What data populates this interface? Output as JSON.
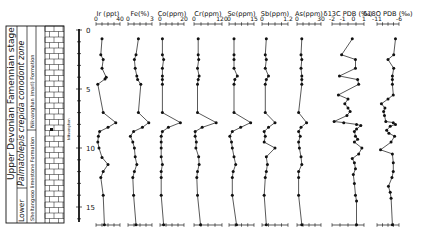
{
  "chart_data": {
    "type": "line",
    "title": "",
    "ylabel": "Depth (m)",
    "y_axis": {
      "ticks": [
        0,
        5,
        10,
        15
      ],
      "range": [
        0,
        16.5
      ],
      "inverted": true
    },
    "stratigraphy": {
      "system_stage": "Upper Devonian  Famennian  stage",
      "substage": "Lower",
      "conodont_zone": "Palmatolepis crepida  conodont zone",
      "formations": [
        {
          "name": "Sheltangxoo limestone Formation",
          "from": 8.5,
          "to": 16.5
        },
        {
          "name": "Nikvanghan (marl) Formation",
          "from": 0,
          "to": 8.5
        }
      ],
      "marker_label": "Nikvanghan",
      "marker_depth": 8.5
    },
    "panels": [
      {
        "name": "Ir (ppt)",
        "xmin": 0,
        "xmax": 40,
        "ticks": [
          "0",
          "40"
        ],
        "points": [
          [
            10,
            1.5
          ],
          [
            8,
            4.2
          ],
          [
            12,
            5
          ],
          [
            10,
            6.5
          ],
          [
            17,
            8
          ],
          [
            15,
            8.3
          ],
          [
            3,
            9.2
          ],
          [
            12,
            14
          ],
          [
            33,
            15.7
          ],
          [
            20,
            16.5
          ],
          [
            6,
            17.2
          ],
          [
            4,
            18
          ],
          [
            3,
            19
          ],
          [
            5,
            20
          ],
          [
            10,
            21.6
          ],
          [
            20,
            22.8
          ],
          [
            12,
            24
          ],
          [
            8,
            25
          ],
          [
            12,
            28
          ],
          [
            14,
            33
          ]
        ]
      },
      {
        "name": "Fe(%)",
        "xmin": 0,
        "xmax": 3,
        "ticks": [
          "0",
          "3"
        ],
        "points": [
          [
            1.3,
            1.5
          ],
          [
            1,
            4.2
          ],
          [
            0.8,
            5
          ],
          [
            0.9,
            6.5
          ],
          [
            1.1,
            7.8
          ],
          [
            1.2,
            8.4
          ],
          [
            1.6,
            9.2
          ],
          [
            1.3,
            14
          ],
          [
            2.6,
            15.7
          ],
          [
            1.8,
            16.5
          ],
          [
            0.7,
            17.2
          ],
          [
            0.3,
            18
          ],
          [
            0.6,
            19
          ],
          [
            0.8,
            20
          ],
          [
            0.9,
            21.5
          ],
          [
            1.1,
            22.8
          ],
          [
            0.8,
            24
          ],
          [
            0.6,
            25
          ],
          [
            0.7,
            28
          ],
          [
            1,
            33
          ]
        ]
      },
      {
        "name": "Co(ppm)",
        "xmin": 0,
        "xmax": 20,
        "ticks": [
          "0",
          "20"
        ],
        "points": [
          [
            2,
            1.5
          ],
          [
            2,
            4.2
          ],
          [
            3,
            5
          ],
          [
            2,
            6.5
          ],
          [
            2,
            7.8
          ],
          [
            2,
            8.4
          ],
          [
            2,
            9.2
          ],
          [
            2,
            14
          ],
          [
            17,
            15.7
          ],
          [
            7,
            16.5
          ],
          [
            2,
            17.2
          ],
          [
            1,
            18
          ],
          [
            1,
            19
          ],
          [
            1,
            20
          ],
          [
            1,
            21.5
          ],
          [
            2,
            22.8
          ],
          [
            1,
            24
          ],
          [
            1,
            25
          ],
          [
            1,
            28
          ],
          [
            3,
            33
          ]
        ]
      },
      {
        "name": "Cr(ppm)",
        "xmin": 0,
        "xmax": 120,
        "ticks": [
          "0",
          "120"
        ],
        "points": [
          [
            18,
            1.5
          ],
          [
            18,
            4.2
          ],
          [
            20,
            5
          ],
          [
            15,
            6.5
          ],
          [
            22,
            7.8
          ],
          [
            18,
            8.4
          ],
          [
            15,
            9.2
          ],
          [
            15,
            14
          ],
          [
            95,
            15.7
          ],
          [
            35,
            16.5
          ],
          [
            5,
            17.2
          ],
          [
            5,
            18
          ],
          [
            10,
            19
          ],
          [
            8,
            20
          ],
          [
            20,
            21.5
          ],
          [
            22,
            22.8
          ],
          [
            15,
            24
          ],
          [
            12,
            25
          ],
          [
            15,
            28
          ],
          [
            28,
            33
          ]
        ]
      },
      {
        "name": "Se(ppm)",
        "xmin": 0,
        "xmax": 15,
        "ticks": [
          "0",
          "15"
        ],
        "points": [
          [
            3,
            1.5
          ],
          [
            3,
            4.2
          ],
          [
            3,
            5
          ],
          [
            3,
            6.5
          ],
          [
            5,
            7.8
          ],
          [
            3.5,
            8.4
          ],
          [
            3,
            9.2
          ],
          [
            3,
            14
          ],
          [
            13,
            15.7
          ],
          [
            7,
            16.5
          ],
          [
            2,
            17.2
          ],
          [
            0.5,
            18
          ],
          [
            1.5,
            19
          ],
          [
            2,
            20
          ],
          [
            3,
            21.5
          ],
          [
            4,
            22.8
          ],
          [
            2.5,
            24
          ],
          [
            2,
            25
          ],
          [
            2,
            28
          ],
          [
            4.5,
            33
          ]
        ]
      },
      {
        "name": "Sb(ppm)",
        "xmin": 0,
        "xmax": 1.2,
        "ticks": [
          "0",
          "1.2"
        ],
        "points": [
          [
            0.2,
            1.5
          ],
          [
            0.15,
            4.2
          ],
          [
            0.2,
            5
          ],
          [
            0.15,
            6.5
          ],
          [
            0.3,
            7.8
          ],
          [
            0.2,
            8.4
          ],
          [
            0.15,
            9.2
          ],
          [
            0.15,
            14
          ],
          [
            0.6,
            15.7
          ],
          [
            0.3,
            16.5
          ],
          [
            0.1,
            17.2
          ],
          [
            0.15,
            18
          ],
          [
            0.1,
            19
          ],
          [
            0.6,
            20
          ],
          [
            0.2,
            21.5
          ],
          [
            0.25,
            22.8
          ],
          [
            0.2,
            24
          ],
          [
            0.15,
            25
          ],
          [
            0.1,
            28
          ],
          [
            0.2,
            33
          ]
        ]
      },
      {
        "name": "As(ppm)",
        "xmin": 0,
        "xmax": 30,
        "ticks": [
          "0",
          "30"
        ],
        "points": [
          [
            6,
            1.5
          ],
          [
            5,
            4.2
          ],
          [
            6,
            5
          ],
          [
            5,
            6.5
          ],
          [
            6,
            7.8
          ],
          [
            6,
            8.4
          ],
          [
            6,
            9.2
          ],
          [
            2,
            14
          ],
          [
            12,
            15.7
          ],
          [
            5,
            16.5
          ],
          [
            2,
            17.2
          ],
          [
            4,
            18
          ],
          [
            2,
            19
          ],
          [
            3,
            20
          ],
          [
            5,
            21.5
          ],
          [
            6,
            22.8
          ],
          [
            2,
            24
          ],
          [
            2,
            25
          ],
          [
            2,
            28
          ],
          [
            6,
            33
          ]
        ]
      },
      {
        "name": "δ13C PDB (‰)",
        "xmin": -2,
        "xmax": 1,
        "ticks": [
          "-2",
          "-1",
          "0",
          "1"
        ],
        "points": [
          [
            -0.1,
            1.5
          ],
          [
            -1.1,
            4.2
          ],
          [
            0.2,
            5
          ],
          [
            0.2,
            6.5
          ],
          [
            -1.3,
            7.8
          ],
          [
            0.4,
            8.4
          ],
          [
            0.5,
            9.2
          ],
          [
            -1.4,
            11
          ],
          [
            -0.5,
            11.7
          ],
          [
            -0.8,
            12.5
          ],
          [
            -0.5,
            13.2
          ],
          [
            -0.3,
            13.8
          ],
          [
            -0.6,
            14.5
          ],
          [
            -1.8,
            15.5
          ],
          [
            -0.9,
            15.7
          ],
          [
            0.3,
            16
          ],
          [
            0.7,
            16.2
          ],
          [
            0.3,
            16.8
          ],
          [
            0.1,
            17.2
          ],
          [
            0.2,
            18
          ],
          [
            0.4,
            18.5
          ],
          [
            0.1,
            19
          ],
          [
            0.8,
            20
          ],
          [
            0.5,
            21
          ],
          [
            -0.1,
            21.8
          ],
          [
            0.1,
            22.5
          ],
          [
            0.2,
            23.5
          ],
          [
            0.0,
            24.5
          ],
          [
            0.1,
            26
          ],
          [
            0.2,
            28
          ],
          [
            0.3,
            29
          ],
          [
            0.3,
            33
          ]
        ]
      },
      {
        "name": "δ18O PDB (‰)",
        "xmin": -11,
        "xmax": -6,
        "ticks": [
          "-11",
          "-6"
        ],
        "points": [
          [
            -6.8,
            1.5
          ],
          [
            -7.2,
            4.2
          ],
          [
            -8.5,
            5
          ],
          [
            -7.2,
            6.5
          ],
          [
            -7.5,
            7.8
          ],
          [
            -7.5,
            8.4
          ],
          [
            -7.5,
            9.2
          ],
          [
            -7.3,
            11
          ],
          [
            -8.5,
            11.7
          ],
          [
            -10,
            12.5
          ],
          [
            -9.2,
            13.2
          ],
          [
            -9.5,
            13.8
          ],
          [
            -9.3,
            14.5
          ],
          [
            -9,
            15.5
          ],
          [
            -7.3,
            15.7
          ],
          [
            -6.8,
            16
          ],
          [
            -8,
            16.3
          ],
          [
            -8.8,
            17
          ],
          [
            -8.3,
            17.5
          ],
          [
            -7,
            18
          ],
          [
            -7.8,
            19
          ],
          [
            -10.2,
            20.3
          ],
          [
            -7.5,
            21
          ],
          [
            -7.3,
            22.5
          ],
          [
            -7.3,
            24
          ],
          [
            -7.6,
            25
          ],
          [
            -8.4,
            26.5
          ],
          [
            -8,
            27.5
          ],
          [
            -7.8,
            28.5
          ],
          [
            -7.5,
            33
          ]
        ]
      }
    ],
    "depth_scale_note": "point y values are in half-metre row units (depth = y/2)"
  }
}
